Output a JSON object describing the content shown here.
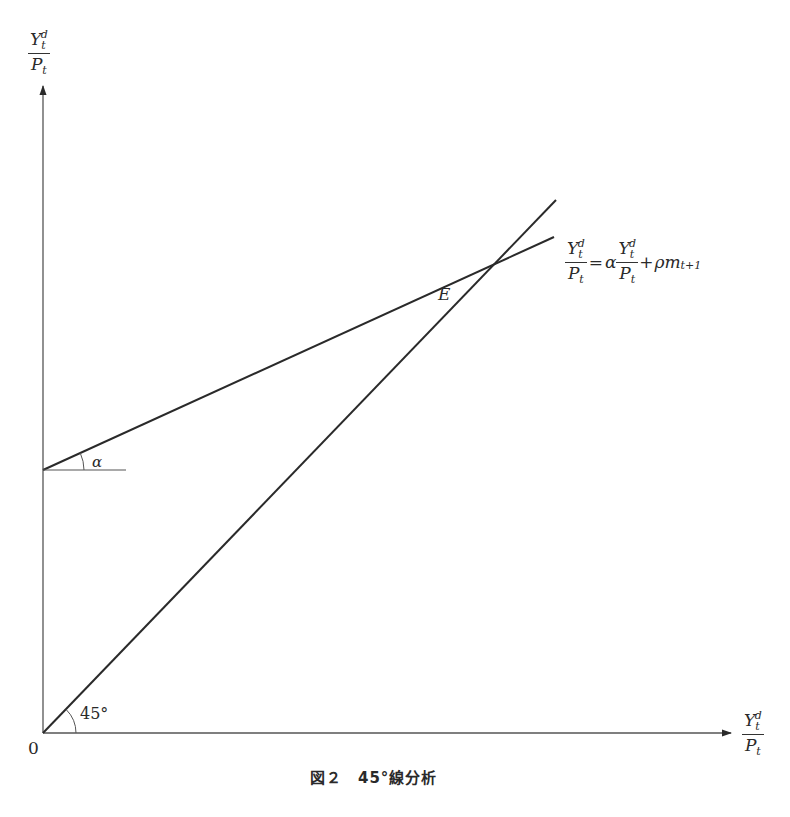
{
  "diagram": {
    "caption": "図２　45°線分析",
    "y_axis_label": {
      "num_base": "Y",
      "num_sub": "t",
      "num_sup": "d",
      "den_base": "P",
      "den_sub": "t"
    },
    "x_axis_label": {
      "num_base": "Y",
      "num_sub": "t",
      "num_sup": "d",
      "den_base": "P",
      "den_sub": "t"
    },
    "origin_label": "0",
    "intersection_label": "E",
    "angle_45_label": "45°",
    "angle_alpha_label": "α",
    "equation": {
      "lhs_num": "Y",
      "lhs_sub": "t",
      "lhs_sup": "d",
      "lhs_den": "P",
      "lhs_den_sub": "t",
      "equals": "=",
      "coef": "α",
      "rhs_num": "Y",
      "rhs_sub": "t",
      "rhs_sup": "d",
      "rhs_den": "P",
      "rhs_den_sub": "t",
      "plus": "+",
      "tail": "ρm",
      "tail_sub": "t+1"
    },
    "line_color": "#2a2a2a"
  }
}
